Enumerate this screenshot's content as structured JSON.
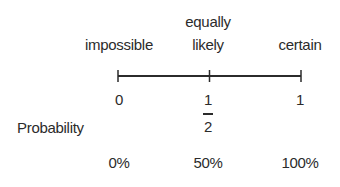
{
  "diagram": {
    "top_labels": [
      {
        "lines": [
          "impossible"
        ],
        "value": 0
      },
      {
        "lines": [
          "equally",
          "likely"
        ],
        "value": 0.5
      },
      {
        "lines": [
          "certain"
        ],
        "value": 1
      }
    ],
    "scale": {
      "min": 0,
      "max": 1,
      "ticks": [
        0,
        0.5,
        1
      ]
    },
    "row_label": "Probability",
    "number_labels": {
      "zero": "0",
      "half_numerator": "1",
      "half_denominator": "2",
      "one": "1"
    },
    "percent_labels": [
      "0%",
      "50%",
      "100%"
    ],
    "colors": {
      "text": "#2b2b2b",
      "line": "#2b2b2b"
    }
  }
}
